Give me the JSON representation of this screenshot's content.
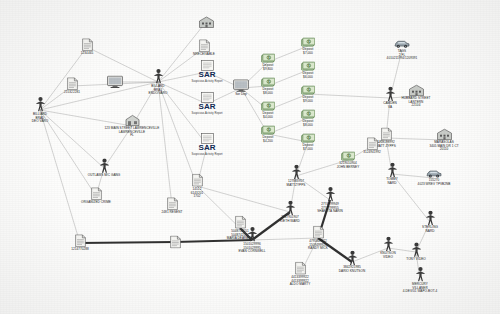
{
  "diagram": {
    "sar_label": "SAR",
    "node_colors": {
      "person": "#3a3a3a",
      "building": "#8a8f93",
      "document": "#f2f2f0",
      "money": "#4f7a3a",
      "car": "#5a6a78",
      "accent": "#1b3f82"
    },
    "nodes": [
      {
        "id": "n1",
        "type": "person",
        "x": 40,
        "y": 110,
        "label": "BILLIARD\nBRAD\nDEO VARO"
      },
      {
        "id": "n2",
        "type": "document",
        "x": 87,
        "y": 47,
        "label": "1234465"
      },
      {
        "id": "n3",
        "type": "document",
        "x": 72,
        "y": 86,
        "label": "215322281"
      },
      {
        "id": "n4",
        "type": "monitor",
        "x": 115,
        "y": 82,
        "label": ""
      },
      {
        "id": "n5",
        "type": "person",
        "x": 158,
        "y": 82,
        "label": "BILLARD\nBRAJ\nENDO/VARO"
      },
      {
        "id": "n6",
        "type": "address",
        "x": 132,
        "y": 126,
        "label": "123 MAIN STREET LAWRENCEVILLE\nLAWRENCEVILLE\nFL"
      },
      {
        "id": "n7",
        "type": "person",
        "x": 104,
        "y": 168,
        "label": "OUTLAWS M/C GANG"
      },
      {
        "id": "n8",
        "type": "document",
        "x": 96,
        "y": 196,
        "label": "ORGANIZED CRIME"
      },
      {
        "id": "n9",
        "type": "document",
        "x": 80,
        "y": 243,
        "label": "1214770288"
      },
      {
        "id": "n10",
        "type": "document",
        "x": 172,
        "y": 206,
        "label": "2481 RESENT"
      },
      {
        "id": "n11",
        "type": "building",
        "x": 206,
        "y": 22,
        "label": ""
      },
      {
        "id": "n12",
        "type": "document",
        "x": 204,
        "y": 48,
        "label": "NRECEIVABLE"
      },
      {
        "id": "n13",
        "type": "sar",
        "x": 207,
        "y": 72,
        "label": "SAR"
      },
      {
        "id": "n14",
        "type": "sar",
        "x": 207,
        "y": 104,
        "label": "SAR"
      },
      {
        "id": "n15",
        "type": "sar",
        "x": 207,
        "y": 145,
        "label": "SAR"
      },
      {
        "id": "n16",
        "type": "document",
        "x": 197,
        "y": 186,
        "label": "14512\n6143201\n1702"
      },
      {
        "id": "n17",
        "type": "monitor",
        "x": 241,
        "y": 88,
        "label": "Sor Dep"
      },
      {
        "id": "n18",
        "type": "money",
        "x": 268,
        "y": 62,
        "label": "Deposit\n$9,800"
      },
      {
        "id": "n19",
        "type": "money",
        "x": 268,
        "y": 86,
        "label": "Deposit\n$8,000"
      },
      {
        "id": "n20",
        "type": "money",
        "x": 268,
        "y": 110,
        "label": "Deposit\n$4,000"
      },
      {
        "id": "n21",
        "type": "money",
        "x": 268,
        "y": 134,
        "label": "Deposit\n$4,200"
      },
      {
        "id": "n22",
        "type": "money",
        "x": 308,
        "y": 46,
        "label": "Deposit\n$7,000"
      },
      {
        "id": "n23",
        "type": "money",
        "x": 308,
        "y": 70,
        "label": "Deposit\n$6,000"
      },
      {
        "id": "n24",
        "type": "money",
        "x": 308,
        "y": 94,
        "label": "Deposit\n$9,000"
      },
      {
        "id": "n25",
        "type": "money",
        "x": 308,
        "y": 118,
        "label": "Deposit\n$8,000"
      },
      {
        "id": "n26",
        "type": "money",
        "x": 308,
        "y": 142,
        "label": "Deposit\n$7,000"
      },
      {
        "id": "n27",
        "type": "person",
        "x": 296,
        "y": 176,
        "label": "127883957\nMATTZYPPS"
      },
      {
        "id": "n28",
        "type": "person",
        "x": 330,
        "y": 200,
        "label": "2774799949\n2774799955\nSHAKOTA NARIN"
      },
      {
        "id": "n29",
        "type": "person",
        "x": 290,
        "y": 212,
        "label": "2747901907\nKIETH WARD"
      },
      {
        "id": "n30",
        "type": "person",
        "x": 252,
        "y": 240,
        "label": "1501029996\n1501029995\nEVAN CORNWELL"
      },
      {
        "id": "n31",
        "type": "document",
        "x": 240,
        "y": 228,
        "label": "5048742551\n5048742550\nMARIA DEARBRO"
      },
      {
        "id": "n32",
        "type": "document",
        "x": 318,
        "y": 238,
        "label": "4795849922\n1509499923\nRANDY MICK"
      },
      {
        "id": "n33",
        "type": "document",
        "x": 300,
        "y": 274,
        "label": "4413399922\n4413399922\nALDO MARTY"
      },
      {
        "id": "n34",
        "type": "person",
        "x": 352,
        "y": 262,
        "label": "3842921985\nDARIO KNUTSON"
      },
      {
        "id": "n35",
        "type": "person",
        "x": 388,
        "y": 248,
        "label": "KNUTSON\nVIDEO"
      },
      {
        "id": "n36",
        "type": "person",
        "x": 390,
        "y": 98,
        "label": "CAMDEN\nVA"
      },
      {
        "id": "n37",
        "type": "building",
        "x": 416,
        "y": 96,
        "label": "HUBBARD STREET\nLANTERN\n22104"
      },
      {
        "id": "n38",
        "type": "car",
        "x": 402,
        "y": 50,
        "label": "TAGS\n2 FL\n4010211994/1209391"
      },
      {
        "id": "n39",
        "type": "building",
        "x": 444,
        "y": 140,
        "label": "MARASOLAS\n3405 MAIN DR 1 CT\n20110"
      },
      {
        "id": "n40",
        "type": "document",
        "x": 386,
        "y": 138,
        "label": "1208198992\nMATT ZYPPS"
      },
      {
        "id": "n41",
        "type": "person",
        "x": 392,
        "y": 174,
        "label": "TOMMY\nNARD"
      },
      {
        "id": "n42",
        "type": "car",
        "x": 434,
        "y": 178,
        "label": "155270\n4023 WREV TPVB2NB"
      },
      {
        "id": "n43",
        "type": "person",
        "x": 430,
        "y": 222,
        "label": "STERLING\nNARD"
      },
      {
        "id": "n44",
        "type": "person",
        "x": 416,
        "y": 252,
        "label": "TONY VIDEO"
      },
      {
        "id": "n45",
        "type": "person",
        "x": 420,
        "y": 280,
        "label": "MERCURY\nVILLANER\n4-DEV/01 WAPO-BOT-4"
      },
      {
        "id": "n46",
        "type": "document",
        "x": 372,
        "y": 146,
        "label": "3124941992"
      },
      {
        "id": "n47",
        "type": "money",
        "x": 348,
        "y": 160,
        "label": "1219010904\nJOHN BERNEY"
      },
      {
        "id": "n48",
        "type": "document",
        "x": 175,
        "y": 242,
        "label": ""
      }
    ],
    "edges": [
      [
        "n1",
        "n2"
      ],
      [
        "n1",
        "n3"
      ],
      [
        "n1",
        "n5"
      ],
      [
        "n1",
        "n6"
      ],
      [
        "n1",
        "n7"
      ],
      [
        "n1",
        "n8"
      ],
      [
        "n1",
        "n9"
      ],
      [
        "n5",
        "n2"
      ],
      [
        "n5",
        "n3"
      ],
      [
        "n5",
        "n4"
      ],
      [
        "n5",
        "n6"
      ],
      [
        "n5",
        "n11"
      ],
      [
        "n5",
        "n12"
      ],
      [
        "n5",
        "n13"
      ],
      [
        "n5",
        "n14"
      ],
      [
        "n5",
        "n15"
      ],
      [
        "n5",
        "n16"
      ],
      [
        "n5",
        "n10"
      ],
      [
        "n7",
        "n8"
      ],
      [
        "n7",
        "n6"
      ],
      [
        "n13",
        "n17"
      ],
      [
        "n14",
        "n17"
      ],
      [
        "n15",
        "n16"
      ],
      [
        "n17",
        "n18"
      ],
      [
        "n17",
        "n19"
      ],
      [
        "n17",
        "n20"
      ],
      [
        "n17",
        "n21"
      ],
      [
        "n18",
        "n22"
      ],
      [
        "n19",
        "n23"
      ],
      [
        "n20",
        "n24"
      ],
      [
        "n21",
        "n25"
      ],
      [
        "n21",
        "n26"
      ],
      [
        "n24",
        "n36"
      ],
      [
        "n36",
        "n37"
      ],
      [
        "n36",
        "n38"
      ],
      [
        "n36",
        "n40"
      ],
      [
        "n40",
        "n39"
      ],
      [
        "n40",
        "n46"
      ],
      [
        "n40",
        "n41"
      ],
      [
        "n41",
        "n42"
      ],
      [
        "n41",
        "n43"
      ],
      [
        "n43",
        "n44"
      ],
      [
        "n44",
        "n45"
      ],
      [
        "n44",
        "n35"
      ],
      [
        "n27",
        "n28"
      ],
      [
        "n27",
        "n29"
      ],
      [
        "n29",
        "n30"
      ],
      [
        "n30",
        "n31"
      ],
      [
        "n30",
        "n32"
      ],
      [
        "n32",
        "n33"
      ],
      [
        "n32",
        "n34"
      ],
      [
        "n34",
        "n35"
      ],
      [
        "n28",
        "n32"
      ],
      [
        "n27",
        "n26"
      ],
      [
        "n27",
        "n47"
      ],
      [
        "n47",
        "n40"
      ],
      [
        "n30",
        "n48"
      ],
      [
        "n48",
        "n9"
      ],
      [
        "n16",
        "n30"
      ],
      [
        "n29",
        "n16"
      ]
    ],
    "thick_edges": [
      [
        "n30",
        "n29"
      ],
      [
        "n29",
        "n28"
      ],
      [
        "n30",
        "n31"
      ],
      [
        "n28",
        "n32"
      ],
      [
        "n32",
        "n34"
      ],
      [
        "n30",
        "n48"
      ],
      [
        "n48",
        "n9"
      ]
    ]
  }
}
